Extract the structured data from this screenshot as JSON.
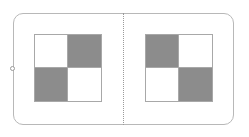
{
  "diagram": {
    "frame": {
      "border_color": "#b8b8b8"
    },
    "divider": {
      "style": "dotted",
      "color": "#9a9a9a"
    },
    "handle": {
      "shape": "circle"
    },
    "panels": [
      {
        "name": "left",
        "cells": [
          "light",
          "dark",
          "dark",
          "light"
        ]
      },
      {
        "name": "right",
        "cells": [
          "dark",
          "light",
          "light",
          "dark"
        ]
      }
    ],
    "colors": {
      "dark": "#8c8c8c",
      "light": "#ffffff",
      "grid_line": "#a8a8a8"
    }
  }
}
